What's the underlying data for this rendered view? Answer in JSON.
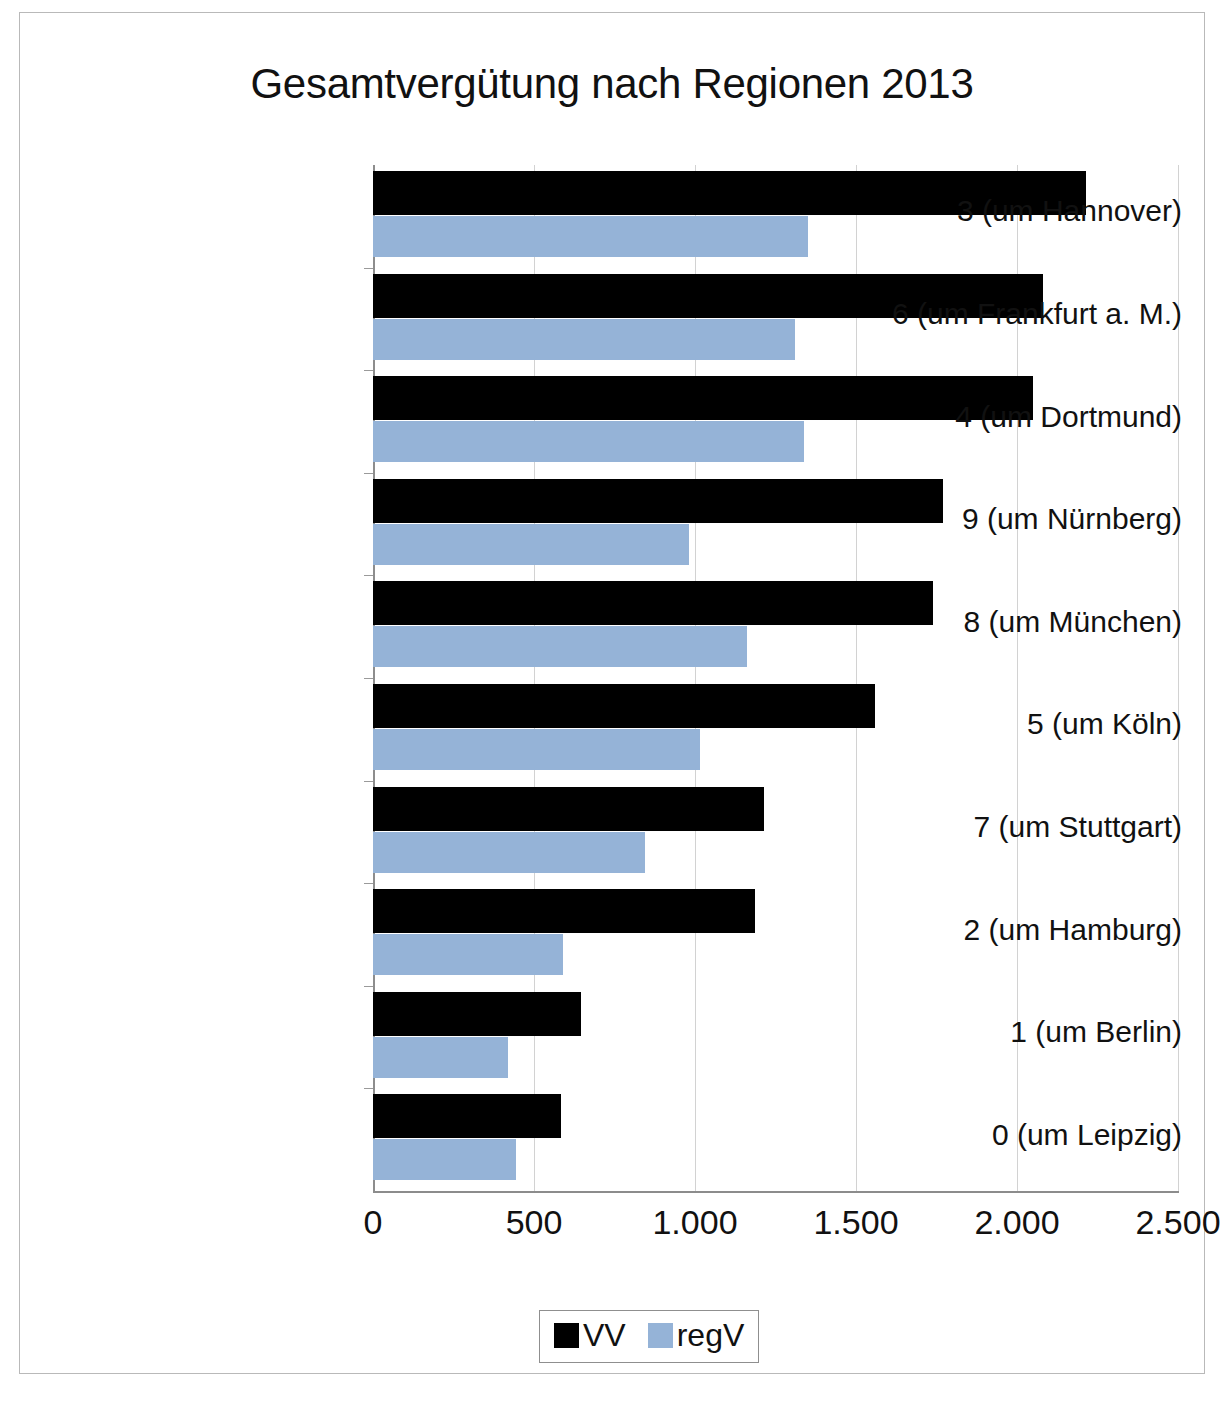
{
  "chart_data": {
    "type": "bar",
    "orientation": "horizontal",
    "title": "Gesamtvergütung nach Regionen 2013",
    "xlabel": "",
    "ylabel": "",
    "xlim": [
      0,
      2500
    ],
    "xticks": [
      0,
      500,
      1000,
      1500,
      2000,
      2500
    ],
    "xtick_labels": [
      "0",
      "500",
      "1.000",
      "1.500",
      "2.000",
      "2.500"
    ],
    "grid": true,
    "legend_position": "bottom",
    "categories": [
      "3 (um Hannover)",
      "6 (um Frankfurt a. M.)",
      "4 (um Dortmund)",
      "9 (um Nürnberg)",
      "8 (um München)",
      "5 (um Köln)",
      "7 (um Stuttgart)",
      "2 (um Hamburg)",
      "1 (um Berlin)",
      "0 (um Leipzig)"
    ],
    "series": [
      {
        "name": "VV",
        "color": "#000000",
        "values": [
          2215,
          2080,
          2050,
          1770,
          1740,
          1560,
          1215,
          1185,
          645,
          585
        ]
      },
      {
        "name": "regV",
        "color": "#95b3d7",
        "values": [
          1350,
          1310,
          1340,
          980,
          1160,
          1015,
          845,
          590,
          420,
          445
        ]
      }
    ]
  },
  "legend": {
    "entries": [
      {
        "label": "VV",
        "color": "#000000"
      },
      {
        "label": "regV",
        "color": "#95b3d7"
      }
    ]
  }
}
